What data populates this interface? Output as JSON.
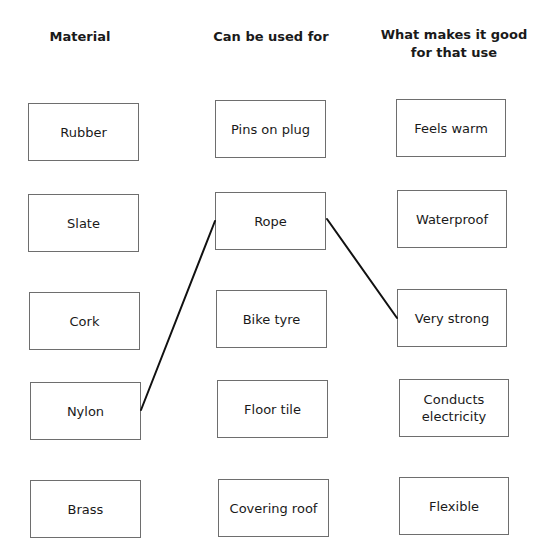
{
  "headers": {
    "material": "Material",
    "use": "Can be used for",
    "property": "What makes it good for that use"
  },
  "columns": {
    "materials": [
      "Rubber",
      "Slate",
      "Cork",
      "Nylon",
      "Brass"
    ],
    "uses": [
      "Pins on plug",
      "Rope",
      "Bike tyre",
      "Floor tile",
      "Covering roof"
    ],
    "properties": [
      "Feels warm",
      "Waterproof",
      "Very strong",
      "Conducts electricity",
      "Flexible"
    ]
  },
  "connections": [
    {
      "from": "Nylon",
      "to": "Rope"
    },
    {
      "from": "Rope",
      "to": "Very strong"
    }
  ],
  "colors": {
    "line": "#111111",
    "box_border": "#6e6e6e"
  }
}
